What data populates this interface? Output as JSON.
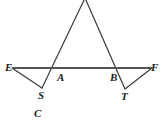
{
  "figure": {
    "type": "geometry-diagram",
    "canvas": {
      "width": 164,
      "height": 120
    },
    "style": {
      "stroke_color": "#3a3a3a",
      "line_color": "#555555",
      "label_color": "#1c1c1c",
      "background": "#ffffff",
      "stroke_width": 1.1,
      "transversal_width": 2.0
    },
    "points": [
      {
        "name": "apex",
        "label": "",
        "x": 85,
        "y": -2
      },
      {
        "name": "E",
        "label": "E",
        "x": 12,
        "y": 68
      },
      {
        "name": "A",
        "label": "A",
        "x": 52,
        "y": 68
      },
      {
        "name": "B",
        "label": "B",
        "x": 118,
        "y": 68
      },
      {
        "name": "F",
        "label": "F",
        "x": 152,
        "y": 68
      },
      {
        "name": "S",
        "label": "S",
        "x": 42,
        "y": 88
      },
      {
        "name": "T",
        "label": "T",
        "x": 125,
        "y": 89
      }
    ],
    "segments": [
      {
        "name": "apex-to-S",
        "from": "apex",
        "to": "S",
        "through": "A"
      },
      {
        "name": "apex-to-T",
        "from": "apex",
        "to": "T",
        "through": "B"
      },
      {
        "name": "line-EF",
        "from": "E",
        "to": "F",
        "through": "A,B"
      },
      {
        "name": "segment-ES",
        "from": "E",
        "to": "S"
      },
      {
        "name": "segment-TF",
        "from": "T",
        "to": "F"
      }
    ],
    "labels": {
      "E": "E",
      "A": "A",
      "B": "B",
      "F": "F",
      "S": "S",
      "T": "T",
      "C": "C"
    }
  }
}
